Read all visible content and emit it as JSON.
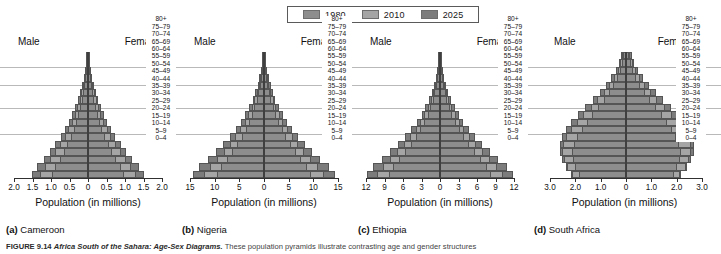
{
  "legend": {
    "items": [
      {
        "label": "1980",
        "color": "#8d8d8d"
      },
      {
        "label": "2010",
        "color": "#a5a5a5"
      },
      {
        "label": "2025",
        "color": "#7c7c7c"
      }
    ]
  },
  "labels": {
    "male": "Male",
    "female": "Female",
    "x_axis_title": "Population (in millions)"
  },
  "age_groups": [
    "80+",
    "75–79",
    "70–74",
    "65–69",
    "60–64",
    "55–59",
    "50–54",
    "45–49",
    "40–44",
    "35–39",
    "30–34",
    "25–29",
    "20–24",
    "15–19",
    "10–14",
    "5–9",
    "0–4"
  ],
  "captions": {
    "cameroon": {
      "letter": "(a)",
      "name": "Cameroon"
    },
    "nigeria": {
      "letter": "(b)",
      "name": "Nigeria"
    },
    "ethiopia": {
      "letter": "(c)",
      "name": "Ethiopia"
    },
    "southafrica": {
      "letter": "(d)",
      "name": "South Africa"
    }
  },
  "figure_caption": {
    "number": "FIGURE 9.14",
    "title": "Africa South of the Sahara: Age-Sex Diagrams.",
    "body": "These population pyramids illustrate contrasting age and gender structures"
  },
  "chart_data": [
    {
      "type": "bar",
      "subtype": "population-pyramid",
      "title": "Cameroon",
      "panel_letter": "(a)",
      "xlabel": "Population (in millions)",
      "ylabel": "",
      "categories": [
        "80+",
        "75–79",
        "70–74",
        "65–69",
        "60–64",
        "55–59",
        "50–54",
        "45–49",
        "40–44",
        "35–39",
        "30–34",
        "25–29",
        "20–24",
        "15–19",
        "10–14",
        "5–9",
        "0–4"
      ],
      "xlim": [
        -2.0,
        2.0
      ],
      "xticks": [
        "2.0",
        "1.5",
        "1.0",
        "0.5",
        "0",
        "0.5",
        "1.0",
        "1.5",
        "2.0"
      ],
      "grid": true,
      "legend_position": "top-center",
      "series": [
        {
          "name": "1980",
          "side": "male",
          "values": [
            0.02,
            0.03,
            0.05,
            0.07,
            0.1,
            0.13,
            0.17,
            0.21,
            0.26,
            0.32,
            0.39,
            0.47,
            0.56,
            0.66,
            0.77,
            0.88,
            0.98
          ]
        },
        {
          "name": "1980",
          "side": "female",
          "values": [
            0.02,
            0.03,
            0.05,
            0.07,
            0.1,
            0.13,
            0.17,
            0.21,
            0.26,
            0.32,
            0.39,
            0.47,
            0.56,
            0.66,
            0.77,
            0.88,
            0.98
          ]
        },
        {
          "name": "2010",
          "side": "male",
          "values": [
            0.03,
            0.05,
            0.07,
            0.1,
            0.14,
            0.18,
            0.23,
            0.29,
            0.36,
            0.44,
            0.53,
            0.63,
            0.75,
            0.88,
            1.02,
            1.17,
            1.3
          ]
        },
        {
          "name": "2010",
          "side": "female",
          "values": [
            0.03,
            0.05,
            0.07,
            0.1,
            0.14,
            0.18,
            0.23,
            0.29,
            0.36,
            0.44,
            0.53,
            0.63,
            0.75,
            0.88,
            1.02,
            1.17,
            1.3
          ]
        },
        {
          "name": "2025",
          "side": "male",
          "values": [
            0.04,
            0.06,
            0.09,
            0.12,
            0.16,
            0.21,
            0.27,
            0.34,
            0.42,
            0.51,
            0.62,
            0.74,
            0.88,
            1.03,
            1.2,
            1.38,
            1.52
          ]
        },
        {
          "name": "2025",
          "side": "female",
          "values": [
            0.04,
            0.06,
            0.09,
            0.12,
            0.16,
            0.21,
            0.27,
            0.34,
            0.42,
            0.51,
            0.62,
            0.74,
            0.88,
            1.03,
            1.2,
            1.38,
            1.52
          ]
        }
      ]
    },
    {
      "type": "bar",
      "subtype": "population-pyramid",
      "title": "Nigeria",
      "panel_letter": "(b)",
      "xlabel": "Population (in millions)",
      "ylabel": "",
      "categories": [
        "80+",
        "75–79",
        "70–74",
        "65–69",
        "60–64",
        "55–59",
        "50–54",
        "45–49",
        "40–44",
        "35–39",
        "30–34",
        "25–29",
        "20–24",
        "15–19",
        "10–14",
        "5–9",
        "0–4"
      ],
      "xlim": [
        -15,
        15
      ],
      "xticks": [
        "15",
        "10",
        "5",
        "0",
        "5",
        "10",
        "15"
      ],
      "grid": true,
      "legend_position": "top-center",
      "series": [
        {
          "name": "1980",
          "side": "male",
          "values": [
            0.15,
            0.25,
            0.4,
            0.6,
            0.85,
            1.15,
            1.5,
            1.95,
            2.45,
            3.05,
            3.75,
            4.55,
            5.45,
            6.45,
            7.55,
            8.65,
            9.5
          ]
        },
        {
          "name": "1980",
          "side": "female",
          "values": [
            0.15,
            0.25,
            0.4,
            0.6,
            0.85,
            1.15,
            1.5,
            1.95,
            2.45,
            3.05,
            3.75,
            4.55,
            5.45,
            6.45,
            7.55,
            8.65,
            9.5
          ]
        },
        {
          "name": "2010",
          "side": "male",
          "values": [
            0.2,
            0.33,
            0.52,
            0.78,
            1.1,
            1.48,
            1.95,
            2.5,
            3.15,
            3.9,
            4.8,
            5.8,
            6.95,
            8.2,
            9.6,
            11.0,
            12.1
          ]
        },
        {
          "name": "2010",
          "side": "female",
          "values": [
            0.2,
            0.33,
            0.52,
            0.78,
            1.1,
            1.48,
            1.95,
            2.5,
            3.15,
            3.9,
            4.8,
            5.8,
            6.95,
            8.2,
            9.6,
            11.0,
            12.1
          ]
        },
        {
          "name": "2025",
          "side": "male",
          "values": [
            0.25,
            0.4,
            0.63,
            0.93,
            1.32,
            1.78,
            2.33,
            3.0,
            3.78,
            4.68,
            5.75,
            6.95,
            8.3,
            9.8,
            11.45,
            13.1,
            14.4
          ]
        },
        {
          "name": "2025",
          "side": "female",
          "values": [
            0.25,
            0.4,
            0.63,
            0.93,
            1.32,
            1.78,
            2.33,
            3.0,
            3.78,
            4.68,
            5.75,
            6.95,
            8.3,
            9.8,
            11.45,
            13.1,
            14.4
          ]
        }
      ]
    },
    {
      "type": "bar",
      "subtype": "population-pyramid",
      "title": "Ethiopia",
      "panel_letter": "(c)",
      "xlabel": "Population (in millions)",
      "ylabel": "",
      "categories": [
        "80+",
        "75–79",
        "70–74",
        "65–69",
        "60–64",
        "55–59",
        "50–54",
        "45–49",
        "40–44",
        "35–39",
        "30–34",
        "25–29",
        "20–24",
        "15–19",
        "10–14",
        "5–9",
        "0–4"
      ],
      "xlim": [
        -12,
        12
      ],
      "xticks": [
        "12",
        "9",
        "6",
        "3",
        "0",
        "3",
        "6",
        "9",
        "12"
      ],
      "grid": true,
      "legend_position": "top-center",
      "series": [
        {
          "name": "1980",
          "side": "male",
          "values": [
            0.1,
            0.18,
            0.3,
            0.45,
            0.65,
            0.9,
            1.2,
            1.58,
            2.02,
            2.55,
            3.18,
            3.9,
            4.72,
            5.62,
            6.6,
            7.58,
            8.35
          ]
        },
        {
          "name": "1980",
          "side": "female",
          "values": [
            0.1,
            0.18,
            0.3,
            0.45,
            0.65,
            0.9,
            1.2,
            1.58,
            2.02,
            2.55,
            3.18,
            3.9,
            4.72,
            5.62,
            6.6,
            7.58,
            8.35
          ]
        },
        {
          "name": "2010",
          "side": "male",
          "values": [
            0.14,
            0.24,
            0.39,
            0.58,
            0.83,
            1.14,
            1.52,
            1.98,
            2.52,
            3.18,
            3.95,
            4.82,
            5.82,
            6.9,
            8.08,
            9.25,
            10.15
          ]
        },
        {
          "name": "2010",
          "side": "female",
          "values": [
            0.14,
            0.24,
            0.39,
            0.58,
            0.83,
            1.14,
            1.52,
            1.98,
            2.52,
            3.18,
            3.95,
            4.82,
            5.82,
            6.9,
            8.08,
            9.25,
            10.15
          ]
        },
        {
          "name": "2025",
          "side": "male",
          "values": [
            0.18,
            0.3,
            0.48,
            0.71,
            1.0,
            1.37,
            1.82,
            2.36,
            3.0,
            3.77,
            4.66,
            5.68,
            6.84,
            8.08,
            9.45,
            10.8,
            11.8
          ]
        },
        {
          "name": "2025",
          "side": "female",
          "values": [
            0.18,
            0.3,
            0.48,
            0.71,
            1.0,
            1.37,
            1.82,
            2.36,
            3.0,
            3.77,
            4.66,
            5.68,
            6.84,
            8.08,
            9.45,
            10.8,
            11.8
          ]
        }
      ]
    },
    {
      "type": "bar",
      "subtype": "population-pyramid",
      "title": "South Africa",
      "panel_letter": "(d)",
      "xlabel": "Population (in millions)",
      "ylabel": "",
      "categories": [
        "80+",
        "75–79",
        "70–74",
        "65–69",
        "60–64",
        "55–59",
        "50–54",
        "45–49",
        "40–44",
        "35–39",
        "30–34",
        "25–29",
        "20–24",
        "15–19",
        "10–14",
        "5–9",
        "0–4"
      ],
      "xlim": [
        -3.0,
        3.0
      ],
      "xticks": [
        "3.0",
        "2.0",
        "1.0",
        "0",
        "1.0",
        "2.0",
        "3.0"
      ],
      "grid": true,
      "legend_position": "top-center",
      "series": [
        {
          "name": "1980",
          "side": "male",
          "values": [
            0.1,
            0.16,
            0.24,
            0.35,
            0.5,
            0.68,
            0.88,
            1.1,
            1.33,
            1.55,
            1.75,
            1.92,
            2.05,
            2.12,
            2.1,
            2.0,
            1.85
          ]
        },
        {
          "name": "1980",
          "side": "female",
          "values": [
            0.12,
            0.19,
            0.28,
            0.4,
            0.56,
            0.75,
            0.96,
            1.18,
            1.41,
            1.63,
            1.83,
            1.99,
            2.11,
            2.17,
            2.14,
            2.03,
            1.88
          ]
        },
        {
          "name": "2010",
          "side": "male",
          "values": [
            0.14,
            0.22,
            0.33,
            0.47,
            0.66,
            0.88,
            1.13,
            1.4,
            1.68,
            1.94,
            2.17,
            2.36,
            2.48,
            2.52,
            2.46,
            2.32,
            2.12
          ]
        },
        {
          "name": "2010",
          "side": "female",
          "values": [
            0.17,
            0.26,
            0.38,
            0.54,
            0.74,
            0.98,
            1.24,
            1.52,
            1.8,
            2.06,
            2.29,
            2.46,
            2.56,
            2.58,
            2.5,
            2.35,
            2.15
          ]
        },
        {
          "name": "2025",
          "side": "male",
          "values": [
            0.18,
            0.28,
            0.41,
            0.58,
            0.79,
            1.04,
            1.32,
            1.61,
            1.9,
            2.16,
            2.38,
            2.54,
            2.62,
            2.62,
            2.53,
            2.37,
            2.16
          ]
        },
        {
          "name": "2025",
          "side": "female",
          "values": [
            0.22,
            0.33,
            0.48,
            0.67,
            0.9,
            1.17,
            1.46,
            1.76,
            2.05,
            2.3,
            2.5,
            2.64,
            2.7,
            2.68,
            2.57,
            2.4,
            2.18
          ]
        }
      ]
    }
  ]
}
